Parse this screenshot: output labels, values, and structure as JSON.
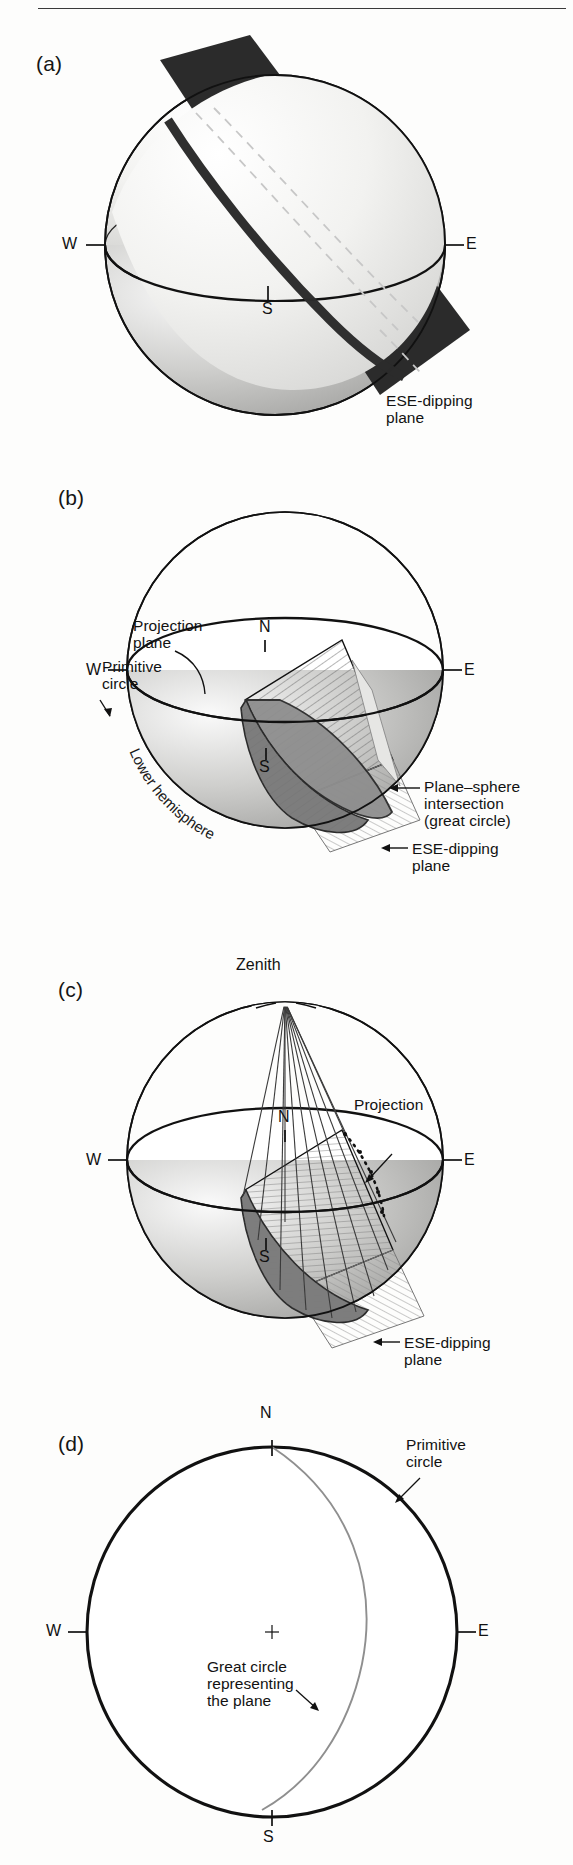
{
  "figure": {
    "top_rule": true,
    "background": "#fdfdfc",
    "ink": "#111111"
  },
  "panels": [
    {
      "id": "a",
      "label": "(a)",
      "caption_labels": [
        {
          "name": "ese-dipping-plane",
          "text": "ESE-dipping\nplane"
        }
      ],
      "cardinals": [
        {
          "name": "west",
          "text": "W"
        },
        {
          "name": "east",
          "text": "E"
        },
        {
          "name": "south",
          "text": "S"
        }
      ]
    },
    {
      "id": "b",
      "label": "(b)",
      "caption_labels": [
        {
          "name": "projection-plane",
          "text": "Projection\nplane"
        },
        {
          "name": "primitive-circle",
          "text": "Primitive\ncircle"
        },
        {
          "name": "plane-sphere-intersection",
          "text": "Plane–sphere\nintersection\n(great circle)"
        },
        {
          "name": "lower-hemisphere",
          "text": "Lower hemisphere"
        },
        {
          "name": "ese-dipping-plane",
          "text": "ESE-dipping\nplane"
        }
      ],
      "cardinals": [
        {
          "name": "west",
          "text": "W"
        },
        {
          "name": "east",
          "text": "E"
        },
        {
          "name": "north",
          "text": "N"
        },
        {
          "name": "south",
          "text": "S"
        }
      ]
    },
    {
      "id": "c",
      "label": "(c)",
      "caption_labels": [
        {
          "name": "zenith",
          "text": "Zenith"
        },
        {
          "name": "projection",
          "text": "Projection"
        },
        {
          "name": "ese-dipping-plane",
          "text": "ESE-dipping\nplane"
        }
      ],
      "cardinals": [
        {
          "name": "west",
          "text": "W"
        },
        {
          "name": "east",
          "text": "E"
        },
        {
          "name": "north",
          "text": "N"
        },
        {
          "name": "south",
          "text": "S"
        }
      ]
    },
    {
      "id": "d",
      "label": "(d)",
      "caption_labels": [
        {
          "name": "primitive-circle",
          "text": "Primitive\ncircle"
        },
        {
          "name": "great-circle-representing-the-plane",
          "text": "Great circle\nrepresenting\nthe plane"
        }
      ],
      "cardinals": [
        {
          "name": "west",
          "text": "W"
        },
        {
          "name": "east",
          "text": "E"
        },
        {
          "name": "north",
          "text": "N"
        },
        {
          "name": "south",
          "text": "S"
        }
      ]
    }
  ],
  "text": {
    "a": {
      "label": "(a)",
      "ese1": "ESE-dipping",
      "ese2": "plane",
      "W": "W",
      "E": "E",
      "S": "S"
    },
    "b": {
      "label": "(b)",
      "proj1": "Projection",
      "proj2": "plane",
      "prim1": "Primitive",
      "prim2": "circle",
      "int1": "Plane–sphere",
      "int2": "intersection",
      "int3": "(great circle)",
      "lower": "Lower hemisphere",
      "ese1": "ESE-dipping",
      "ese2": "plane",
      "W": "W",
      "E": "E",
      "N": "N",
      "S": "S"
    },
    "c": {
      "label": "(c)",
      "zenith": "Zenith",
      "projection": "Projection",
      "ese1": "ESE-dipping",
      "ese2": "plane",
      "W": "W",
      "E": "E",
      "N": "N",
      "S": "S"
    },
    "d": {
      "label": "(d)",
      "prim1": "Primitive",
      "prim2": "circle",
      "gc1": "Great circle",
      "gc2": "representing",
      "gc3": "the plane",
      "W": "W",
      "E": "E",
      "N": "N",
      "S": "S"
    }
  },
  "colors": {
    "sphere_light": "#f6f6f4",
    "sphere_shadow": "#b9b9b9",
    "plane_dark": "#2b2b2b",
    "great_circle_fill": "#8e8e8e",
    "hatch": "#6d6d6d",
    "outline": "#111111",
    "dashed": "#c9c9c9",
    "thin_curve": "#8a8a8a"
  }
}
